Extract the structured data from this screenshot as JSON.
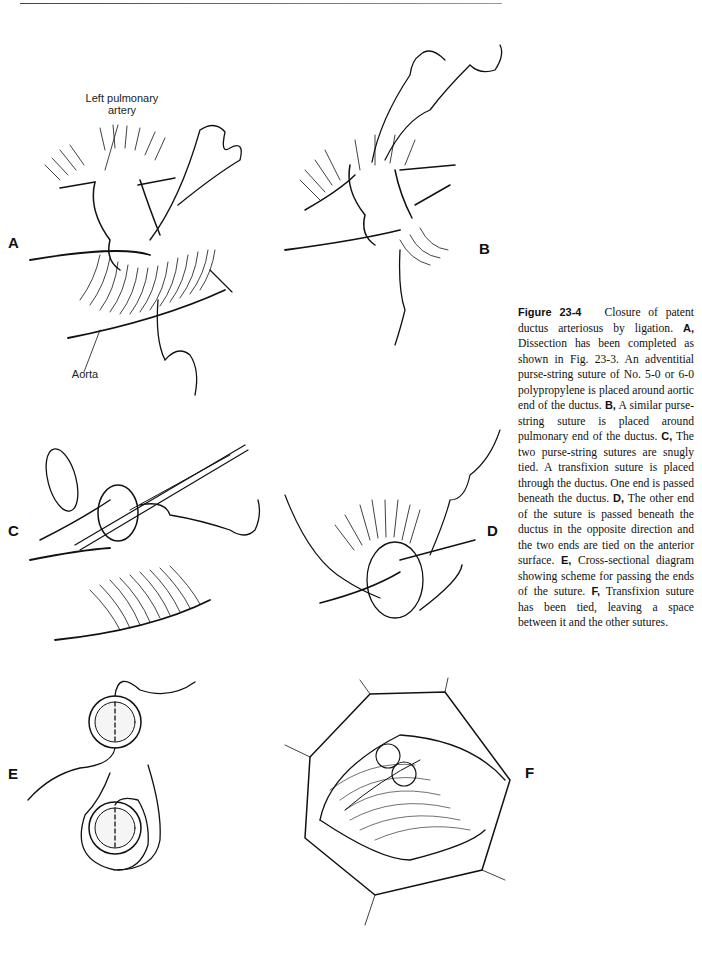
{
  "page": {
    "figure_number": "Figure 23-4",
    "caption_intro": "Closure of patent ductus arteriosus by ligation.",
    "caption_parts": [
      {
        "label": "A,",
        "text": "Dissection has been completed as shown in Fig. 23-3. An adventitial purse-string suture of No. 5-0 or 6-0 polypropylene is placed around aortic end of the ductus."
      },
      {
        "label": "B,",
        "text": "A similar purse-string suture is placed around pulmonary end of the ductus."
      },
      {
        "label": "C,",
        "text": "The two purse-string sutures are snugly tied. A transfixion suture is placed through the ductus. One end is passed beneath the ductus."
      },
      {
        "label": "D,",
        "text": "The other end of the suture is passed beneath the ductus in the opposite direction and the two ends are tied on the anterior surface."
      },
      {
        "label": "E,",
        "text": "Cross-sectional diagram showing scheme for passing the ends of the suture."
      },
      {
        "label": "F,",
        "text": "Transfixion suture has been tied, leaving a space between it and the other sutures."
      }
    ]
  },
  "panels": {
    "a": {
      "label": "A",
      "annotations": {
        "top": "Left pulmonary\nartery",
        "top_line1": "Left pulmonary",
        "top_line2": "artery",
        "bottom": "Aorta"
      }
    },
    "b": {
      "label": "B"
    },
    "c": {
      "label": "C"
    },
    "d": {
      "label": "D"
    },
    "e": {
      "label": "E"
    },
    "f": {
      "label": "F"
    }
  },
  "colors": {
    "ink": "#111111",
    "background": "#ffffff",
    "rule": "#555555"
  }
}
